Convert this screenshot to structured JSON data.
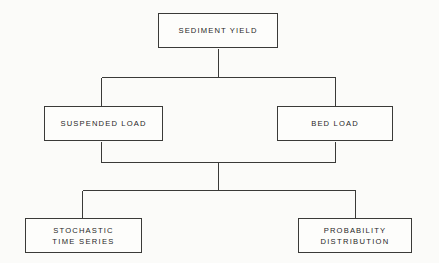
{
  "diagram": {
    "type": "flowchart",
    "background_color": "#fbfbf9",
    "line_color": "#3a3a38",
    "text_color": "#1f1f1f",
    "nodes": [
      {
        "id": "sediment-yield",
        "label": "SEDIMENT YIELD",
        "level": 1,
        "x": 158,
        "y": 13,
        "width": 120,
        "height": 35
      },
      {
        "id": "suspended-load",
        "label": "SUSPENDED LOAD",
        "level": 2,
        "x": 44,
        "y": 106,
        "width": 119,
        "height": 35
      },
      {
        "id": "bed-load",
        "label": "BED LOAD",
        "level": 2,
        "x": 277,
        "y": 106,
        "width": 116,
        "height": 35
      },
      {
        "id": "stochastic-time-series",
        "label_line1": "STOCHASTIC",
        "label_line2": "TIME SERIES",
        "level": 3,
        "x": 25,
        "y": 218,
        "width": 117,
        "height": 35
      },
      {
        "id": "probability-distribution",
        "label_line1": "PROBABILITY",
        "label_line2": "DISTRIBUTION",
        "level": 3,
        "x": 298,
        "y": 218,
        "width": 114,
        "height": 35
      }
    ],
    "connections": [
      {
        "id": "yield-to-split",
        "from": "sediment-yield",
        "to": [
          "suspended-load",
          "bed-load"
        ],
        "style": "orthogonal-split"
      },
      {
        "id": "loads-to-merge",
        "from": [
          "suspended-load",
          "bed-load"
        ],
        "to": "merge-bus",
        "style": "orthogonal-merge"
      },
      {
        "id": "merge-to-outputs",
        "from": "merge-bus",
        "to": [
          "stochastic-time-series",
          "probability-distribution"
        ],
        "style": "orthogonal-split"
      }
    ]
  }
}
